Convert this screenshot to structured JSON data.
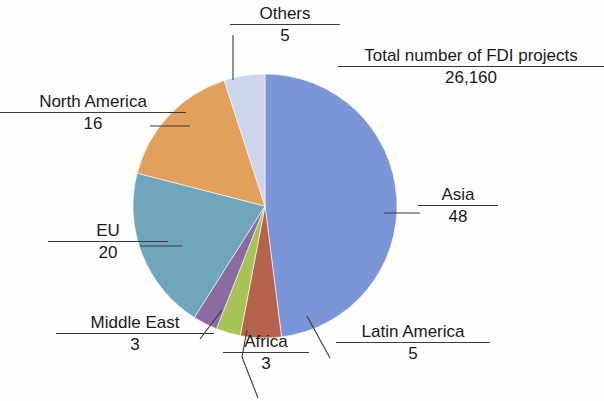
{
  "figure": {
    "partial_caption_above": "",
    "background_color": "#ffffff",
    "text_color": "#1a1a1a",
    "leader_line_color": "#3a3a3a"
  },
  "total_callout": {
    "label": "Total number of FDI projects",
    "value": "26,160"
  },
  "callouts": [
    {
      "key": "asia",
      "label": "Asia",
      "value": "48"
    },
    {
      "key": "latin",
      "label": "Latin America",
      "value": "5"
    },
    {
      "key": "africa",
      "label": "Africa",
      "value": "3"
    },
    {
      "key": "mideast",
      "label": "Middle East",
      "value": "3"
    },
    {
      "key": "eu",
      "label": "EU",
      "value": "20"
    },
    {
      "key": "na",
      "label": "North America",
      "value": "16"
    },
    {
      "key": "others",
      "label": "Others",
      "value": "5"
    }
  ],
  "chart_data": {
    "type": "pie",
    "title": "",
    "subtitle": "",
    "xlabel": "",
    "ylabel": "",
    "units": "percent",
    "total_label": "Total number of FDI projects",
    "total_value": 26160,
    "total_value_text": "26,160",
    "start_angle_deg": 0,
    "direction": "clockwise",
    "legend": "none (direct callout labels with leader lines)",
    "grid": false,
    "categories": [
      "Asia",
      "Latin America",
      "Africa",
      "Middle East",
      "EU",
      "North America",
      "Others"
    ],
    "values": [
      48,
      5,
      3,
      3,
      20,
      16,
      5
    ],
    "colors": [
      "#7b95d6",
      "#b5634d",
      "#a9c255",
      "#8a6ba2",
      "#6fa6bb",
      "#e3a05c",
      "#ccd5ec"
    ],
    "slices": [
      {
        "name": "Asia",
        "value": 48,
        "color": "#7b95d6"
      },
      {
        "name": "Latin America",
        "value": 5,
        "color": "#b5634d"
      },
      {
        "name": "Africa",
        "value": 3,
        "color": "#a9c255"
      },
      {
        "name": "Middle East",
        "value": 3,
        "color": "#8a6ba2"
      },
      {
        "name": "EU",
        "value": 20,
        "color": "#6fa6bb"
      },
      {
        "name": "North America",
        "value": 16,
        "color": "#e3a05c"
      },
      {
        "name": "Others",
        "value": 5,
        "color": "#ccd5ec"
      }
    ],
    "geometry": {
      "cx": 265,
      "cy": 206,
      "r": 132
    }
  }
}
